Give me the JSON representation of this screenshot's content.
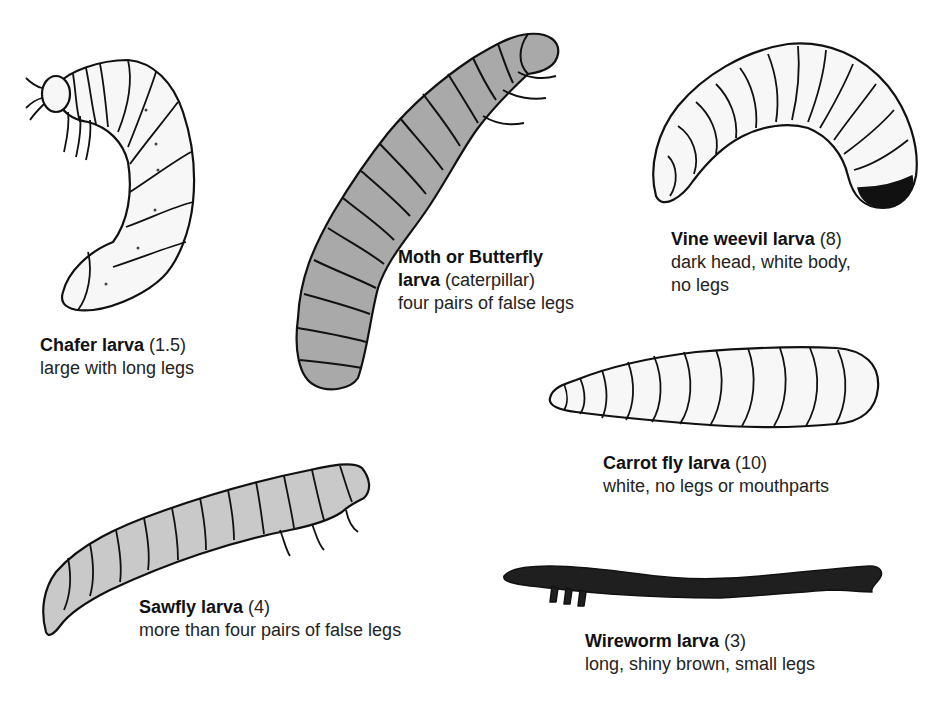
{
  "colors": {
    "outline": "#111111",
    "pale_fill": "#f7f7f7",
    "grey_fill": "#a9a9a9",
    "sawfly_fill": "#c9c9c9",
    "dark_fill": "#1f1f1f",
    "text": "#232323"
  },
  "larvae": [
    {
      "id": "chafer",
      "icon": "chafer-larva-icon",
      "name": "Chafer larva",
      "size": "(1.5)",
      "desc_lines": [
        "large with long legs"
      ]
    },
    {
      "id": "moth",
      "icon": "caterpillar-icon",
      "name": "Moth or Butterfly",
      "name_line2": "larva",
      "size": "(caterpillar)",
      "desc_lines": [
        "four pairs of false legs"
      ]
    },
    {
      "id": "vine_weevil",
      "icon": "vine-weevil-larva-icon",
      "name": "Vine weevil larva",
      "size": "(8)",
      "desc_lines": [
        "dark head, white body,",
        "no legs"
      ]
    },
    {
      "id": "carrot_fly",
      "icon": "carrot-fly-larva-icon",
      "name": "Carrot fly larva",
      "size": "(10)",
      "desc_lines": [
        "white, no legs or mouthparts"
      ]
    },
    {
      "id": "sawfly",
      "icon": "sawfly-larva-icon",
      "name": "Sawfly larva",
      "size": "(4)",
      "desc_lines": [
        "more than four pairs of false legs"
      ]
    },
    {
      "id": "wireworm",
      "icon": "wireworm-larva-icon",
      "name": "Wireworm larva",
      "size": "(3)",
      "desc_lines": [
        "long, shiny brown, small legs"
      ]
    }
  ]
}
